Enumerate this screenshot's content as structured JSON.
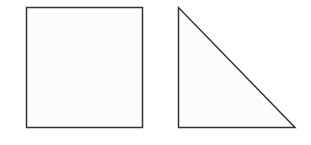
{
  "diagram": {
    "shapes": [
      {
        "type": "square",
        "x": 26,
        "y": 7,
        "width": 117,
        "height": 120
      },
      {
        "type": "right-triangle",
        "points": [
          [
            178,
            7
          ],
          [
            178,
            127
          ],
          [
            295,
            127
          ]
        ]
      }
    ],
    "colors": {
      "stroke": "#333333",
      "fill": "#fcfcfc",
      "background": "#ffffff"
    }
  }
}
